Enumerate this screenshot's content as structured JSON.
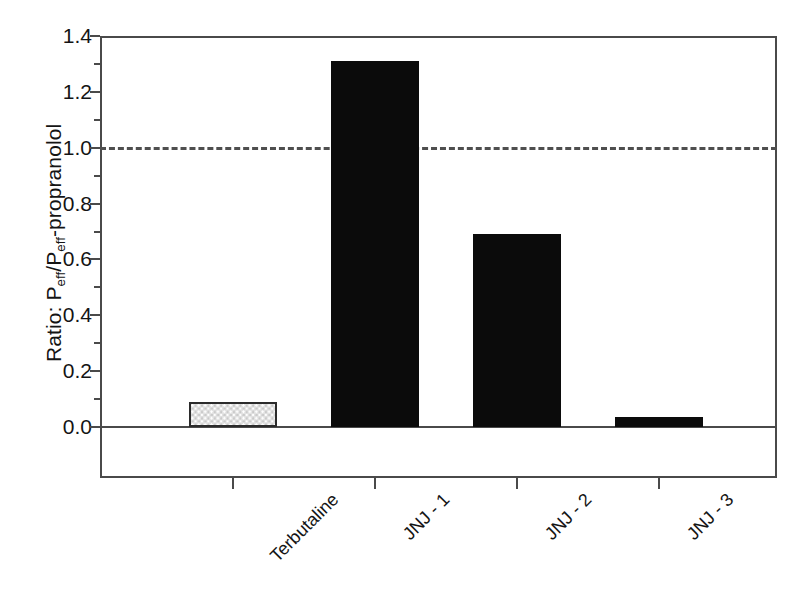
{
  "chart_data": {
    "type": "bar",
    "title": "",
    "subtitle": "",
    "xlabel": "",
    "ylabel_text": "Ratio: Peff/Peff-propranolol",
    "ylabel_parts": {
      "prefix": "Ratio: P",
      "sub1": "eff",
      "mid": "/P",
      "sub2": "eff",
      "suffix": "-propranolol"
    },
    "categories": [
      "Terbutaline",
      "JNJ - 1",
      "JNJ - 2",
      "JNJ - 3"
    ],
    "values": [
      0.09,
      1.31,
      0.69,
      0.035
    ],
    "bar_styles": [
      "stippled-gray",
      "solid-black",
      "solid-black",
      "solid-black"
    ],
    "ylim": [
      -0.18,
      1.4
    ],
    "ytick_values": [
      0.0,
      0.2,
      0.4,
      0.6,
      0.8,
      1.0,
      1.2,
      1.4
    ],
    "ytick_labels": [
      "0.0",
      "0.2",
      "0.4",
      "0.6",
      "0.8",
      "1.0",
      "1.2",
      "1.4"
    ],
    "yminor_tick_values": [
      0.1,
      0.3,
      0.5,
      0.7,
      0.9,
      1.1,
      1.3
    ],
    "grid": false,
    "legend": null,
    "annotations": [
      {
        "name": "unity-reference-line",
        "type": "hline",
        "value": 1.0,
        "style": "dashed",
        "color": "#4f4f4f"
      },
      {
        "name": "zero-baseline",
        "type": "hline",
        "value": 0.0,
        "style": "solid",
        "color": "#4a4a4a"
      }
    ],
    "colors": {
      "solid_bar": "#0b0b0b",
      "stipple_bar_fill": "#e2e2e2",
      "stipple_bar_edge": "#2b2b2b",
      "axis": "#4a4a4a",
      "text": "#141414",
      "background": "#ffffff"
    },
    "xtick_rotation_deg": -45
  }
}
